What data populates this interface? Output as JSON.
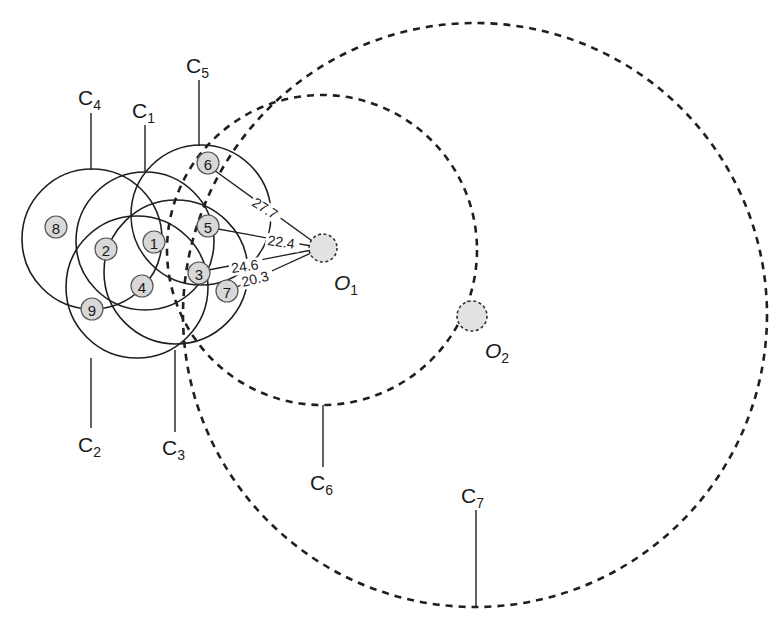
{
  "diagram": {
    "circles": [
      {
        "id": "C1",
        "letter": "C",
        "sub": "1",
        "style": "solid"
      },
      {
        "id": "C2",
        "letter": "C",
        "sub": "2",
        "style": "solid"
      },
      {
        "id": "C3",
        "letter": "C",
        "sub": "3",
        "style": "solid"
      },
      {
        "id": "C4",
        "letter": "C",
        "sub": "4",
        "style": "solid"
      },
      {
        "id": "C5",
        "letter": "C",
        "sub": "5",
        "style": "solid"
      },
      {
        "id": "C6",
        "letter": "C",
        "sub": "6",
        "style": "dashed"
      },
      {
        "id": "C7",
        "letter": "C",
        "sub": "7",
        "style": "dashed"
      }
    ],
    "nodes": [
      {
        "label": "1"
      },
      {
        "label": "2"
      },
      {
        "label": "3"
      },
      {
        "label": "4"
      },
      {
        "label": "5"
      },
      {
        "label": "6"
      },
      {
        "label": "7"
      },
      {
        "label": "8"
      },
      {
        "label": "9"
      }
    ],
    "origins": [
      {
        "letter": "O",
        "sub": "1"
      },
      {
        "letter": "O",
        "sub": "2"
      }
    ],
    "distances": [
      {
        "from": "6",
        "to": "O1",
        "value": "27.7"
      },
      {
        "from": "5",
        "to": "O1",
        "value": "22.4"
      },
      {
        "from": "3",
        "to": "O1",
        "value": "24.6"
      },
      {
        "from": "7",
        "to": "O1",
        "value": "20.3"
      }
    ],
    "colors": {
      "stroke": "#1f1f1f",
      "node_fill": "#d8d8d8",
      "origin_fill": "#e2e2e2",
      "background": "#ffffff"
    }
  }
}
